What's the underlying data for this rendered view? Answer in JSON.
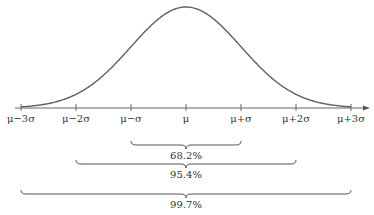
{
  "chart_data": {
    "type": "line",
    "title": "",
    "x_ticks": [
      "μ−3σ",
      "μ−2σ",
      "μ−σ",
      "μ",
      "μ+σ",
      "μ+2σ",
      "μ+3σ"
    ],
    "intervals": [
      {
        "range": [
          "μ−σ",
          "μ+σ"
        ],
        "label": "68.2%"
      },
      {
        "range": [
          "μ−2σ",
          "μ+2σ"
        ],
        "label": "95.4%"
      },
      {
        "range": [
          "μ−3σ",
          "μ+3σ"
        ],
        "label": "99.7%"
      }
    ]
  },
  "axis": {
    "ticks": [
      "μ−3σ",
      "μ−2σ",
      "μ−σ",
      "μ",
      "μ+σ",
      "μ+2σ",
      "μ+3σ"
    ]
  },
  "braces": {
    "one_sigma": "68.2%",
    "two_sigma": "95.4%",
    "three_sigma": "99.7%"
  },
  "colors": {
    "curve": "#555555",
    "axis": "#555555",
    "text": "#333333"
  }
}
